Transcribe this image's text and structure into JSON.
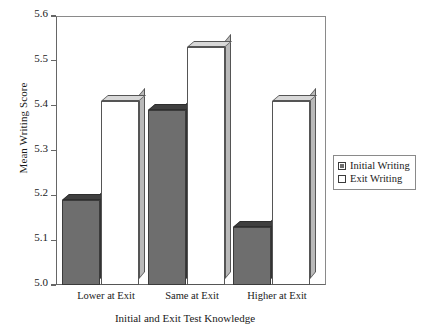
{
  "chart_data": {
    "type": "bar",
    "title": "",
    "xlabel": "Initial and Exit Test Knowledge",
    "ylabel": "Mean Writing Score",
    "categories": [
      "Lower at Exit",
      "Same at Exit",
      "Higher at Exit"
    ],
    "series": [
      {
        "name": "Initial Writing",
        "values": [
          5.19,
          5.39,
          5.13
        ],
        "color": "#6e6e6e"
      },
      {
        "name": "Exit Writing",
        "values": [
          5.41,
          5.53,
          5.41
        ],
        "color": "#ffffff"
      }
    ],
    "ylim": [
      5.0,
      5.6
    ],
    "yticks": [
      "5.0",
      "5.1",
      "5.2",
      "5.3",
      "5.4",
      "5.5",
      "5.6"
    ],
    "ytick_values": [
      5.0,
      5.1,
      5.2,
      5.3,
      5.4,
      5.5,
      5.6
    ],
    "grid": false,
    "legend_position": "right",
    "style": "3d-bar"
  },
  "legend": {
    "entries": [
      {
        "label": "Initial Writing",
        "swatch": "filled-square-icon"
      },
      {
        "label": "Exit Writing",
        "swatch": "empty-square-icon"
      }
    ]
  }
}
